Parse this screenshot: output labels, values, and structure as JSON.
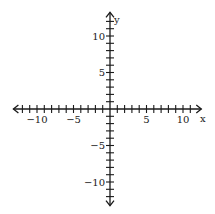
{
  "chart_data": {
    "type": "scatter",
    "title": "",
    "xlabel": "x",
    "ylabel": "y",
    "xlim": [
      -12,
      11
    ],
    "ylim": [
      -12,
      12
    ],
    "grid": false,
    "x_tick_step": 1,
    "y_tick_step": 1,
    "x_tick_labels": [
      {
        "value": -10,
        "label": "-10"
      },
      {
        "value": -5,
        "label": "-5"
      },
      {
        "value": 5,
        "label": "5"
      },
      {
        "value": 10,
        "label": "10"
      }
    ],
    "y_tick_labels": [
      {
        "value": 10,
        "label": "10"
      },
      {
        "value": 5,
        "label": "5"
      },
      {
        "value": -5,
        "label": "-5"
      },
      {
        "value": -10,
        "label": "-10"
      }
    ],
    "series": [],
    "axis_color": "#1a1a1a"
  },
  "axes": {
    "x_label": "x",
    "y_label": "y"
  }
}
